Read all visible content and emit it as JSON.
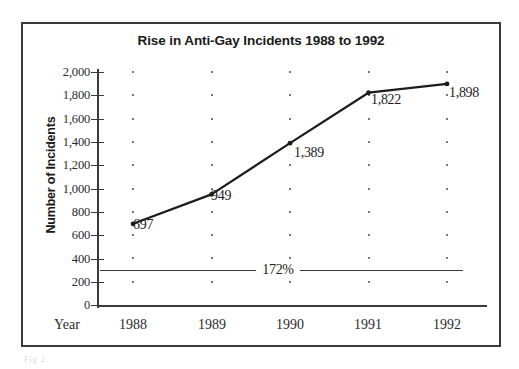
{
  "chart_data": {
    "type": "line",
    "title": "Rise in Anti-Gay Incidents 1988 to 1992",
    "xlabel": "Year",
    "ylabel": "Number of Incidents",
    "categories": [
      "1988",
      "1989",
      "1990",
      "1991",
      "1992"
    ],
    "values": [
      697,
      949,
      1389,
      1822,
      1898
    ],
    "point_labels": [
      "697",
      "949",
      "1,389",
      "1,822",
      "1,898"
    ],
    "ylim": [
      0,
      2000
    ],
    "yticks": [
      0,
      200,
      400,
      600,
      800,
      1000,
      1200,
      1400,
      1600,
      1800,
      2000
    ],
    "ytick_labels": [
      "0",
      "200",
      "400",
      "600",
      "800",
      "1,000",
      "1,200",
      "1,400",
      "1,600",
      "1,800",
      "2,000"
    ],
    "grid": "dotted-points",
    "legend": null,
    "annotations": [
      {
        "name": "percent-change-line",
        "text": "172%",
        "value": 300,
        "type": "horizontal-line-with-centered-label"
      }
    ],
    "series": [
      {
        "name": "Number of Incidents",
        "values": [
          697,
          949,
          1389,
          1822,
          1898
        ],
        "marker": "dot",
        "color": "#1c1c1c"
      }
    ]
  },
  "figure": {
    "border_color": "#3a3a3a",
    "background": "#ffffff",
    "line_color": "#1c1c1c",
    "artifact_text": "Fig 2"
  }
}
